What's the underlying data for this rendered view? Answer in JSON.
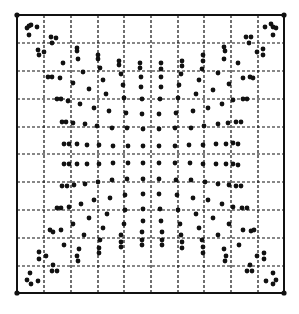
{
  "diagram": {
    "type": "dot-grid-distortion",
    "colors": {
      "background": "#ffffff",
      "ink": "#111111"
    },
    "frame": {
      "x0": 17,
      "y0": 15,
      "x1": 284,
      "y1": 293
    },
    "grid": {
      "columns": 10,
      "rows": 10,
      "vertical_lines": [
        44,
        71,
        98,
        124,
        151,
        178,
        204,
        231,
        258
      ],
      "horizontal_lines": [
        43,
        71,
        99,
        127,
        154,
        182,
        210,
        238,
        266
      ]
    },
    "corner_markers": [
      [
        17,
        15
      ],
      [
        284,
        15
      ],
      [
        17,
        293
      ],
      [
        284,
        293
      ]
    ],
    "dot_radius": 2.4,
    "dots": [
      [
        27,
        28
      ],
      [
        29,
        26
      ],
      [
        31,
        25
      ],
      [
        37,
        27
      ],
      [
        29,
        35
      ],
      [
        51,
        37
      ],
      [
        56,
        38
      ],
      [
        52,
        43
      ],
      [
        38,
        50
      ],
      [
        44,
        52
      ],
      [
        39,
        55
      ],
      [
        77,
        48
      ],
      [
        77,
        51
      ],
      [
        78,
        59
      ],
      [
        63,
        63
      ],
      [
        98,
        55
      ],
      [
        98,
        59
      ],
      [
        100,
        68
      ],
      [
        83,
        72
      ],
      [
        119,
        61
      ],
      [
        119,
        65
      ],
      [
        121,
        74
      ],
      [
        140,
        63
      ],
      [
        140,
        68
      ],
      [
        141,
        77
      ],
      [
        48,
        77
      ],
      [
        52,
        77
      ],
      [
        60,
        78
      ],
      [
        73,
        83
      ],
      [
        89,
        89
      ],
      [
        103,
        80
      ],
      [
        123,
        85
      ],
      [
        141,
        87
      ],
      [
        57,
        99
      ],
      [
        61,
        99
      ],
      [
        68,
        101
      ],
      [
        80,
        104
      ],
      [
        94,
        108
      ],
      [
        106,
        94
      ],
      [
        109,
        111
      ],
      [
        124,
        98
      ],
      [
        126,
        113
      ],
      [
        142,
        99
      ],
      [
        142,
        114
      ],
      [
        62,
        122
      ],
      [
        66,
        122
      ],
      [
        73,
        123
      ],
      [
        85,
        124
      ],
      [
        97,
        126
      ],
      [
        112,
        128
      ],
      [
        127,
        128
      ],
      [
        143,
        129
      ],
      [
        64,
        144
      ],
      [
        69,
        144
      ],
      [
        77,
        144
      ],
      [
        87,
        145
      ],
      [
        99,
        145
      ],
      [
        113,
        146
      ],
      [
        128,
        146
      ],
      [
        143,
        146
      ],
      [
        265,
        27
      ],
      [
        271,
        24
      ],
      [
        273,
        27
      ],
      [
        276,
        28
      ],
      [
        273,
        35
      ],
      [
        246,
        37
      ],
      [
        251,
        37
      ],
      [
        249,
        43
      ],
      [
        257,
        52
      ],
      [
        263,
        49
      ],
      [
        263,
        55
      ],
      [
        224,
        47
      ],
      [
        225,
        51
      ],
      [
        224,
        59
      ],
      [
        238,
        63
      ],
      [
        203,
        55
      ],
      [
        203,
        61
      ],
      [
        202,
        69
      ],
      [
        182,
        61
      ],
      [
        182,
        66
      ],
      [
        181,
        74
      ],
      [
        161,
        63
      ],
      [
        161,
        69
      ],
      [
        161,
        77
      ],
      [
        218,
        73
      ],
      [
        243,
        78
      ],
      [
        250,
        77
      ],
      [
        253,
        78
      ],
      [
        229,
        84
      ],
      [
        213,
        90
      ],
      [
        199,
        80
      ],
      [
        179,
        85
      ],
      [
        161,
        87
      ],
      [
        233,
        100
      ],
      [
        243,
        99
      ],
      [
        247,
        99
      ],
      [
        222,
        104
      ],
      [
        208,
        108
      ],
      [
        196,
        94
      ],
      [
        193,
        111
      ],
      [
        178,
        98
      ],
      [
        176,
        113
      ],
      [
        160,
        99
      ],
      [
        159,
        114
      ],
      [
        228,
        123
      ],
      [
        236,
        122
      ],
      [
        241,
        122
      ],
      [
        218,
        124
      ],
      [
        204,
        126
      ],
      [
        191,
        128
      ],
      [
        175,
        128
      ],
      [
        159,
        129
      ],
      [
        216,
        144
      ],
      [
        226,
        144
      ],
      [
        233,
        143
      ],
      [
        238,
        144
      ],
      [
        203,
        145
      ],
      [
        189,
        145
      ],
      [
        175,
        146
      ],
      [
        159,
        146
      ],
      [
        64,
        164
      ],
      [
        69,
        164
      ],
      [
        77,
        164
      ],
      [
        87,
        164
      ],
      [
        99,
        164
      ],
      [
        113,
        163
      ],
      [
        128,
        163
      ],
      [
        143,
        163
      ],
      [
        62,
        186
      ],
      [
        67,
        186
      ],
      [
        74,
        185
      ],
      [
        85,
        184
      ],
      [
        98,
        182
      ],
      [
        112,
        180
      ],
      [
        127,
        179
      ],
      [
        143,
        179
      ],
      [
        57,
        208
      ],
      [
        61,
        208
      ],
      [
        69,
        207
      ],
      [
        81,
        204
      ],
      [
        94,
        200
      ],
      [
        107,
        214
      ],
      [
        110,
        198
      ],
      [
        125,
        195
      ],
      [
        125,
        210
      ],
      [
        124,
        224
      ],
      [
        143,
        194
      ],
      [
        143,
        209
      ],
      [
        143,
        221
      ],
      [
        50,
        230
      ],
      [
        53,
        232
      ],
      [
        61,
        230
      ],
      [
        73,
        224
      ],
      [
        89,
        218
      ],
      [
        103,
        228
      ],
      [
        64,
        245
      ],
      [
        84,
        235
      ],
      [
        100,
        240
      ],
      [
        99,
        248
      ],
      [
        99,
        253
      ],
      [
        121,
        235
      ],
      [
        121,
        242
      ],
      [
        121,
        247
      ],
      [
        142,
        232
      ],
      [
        142,
        240
      ],
      [
        142,
        245
      ],
      [
        79,
        249
      ],
      [
        77,
        256
      ],
      [
        78,
        261
      ],
      [
        39,
        252
      ],
      [
        39,
        259
      ],
      [
        46,
        256
      ],
      [
        53,
        265
      ],
      [
        52,
        271
      ],
      [
        57,
        271
      ],
      [
        30,
        273
      ],
      [
        27,
        280
      ],
      [
        31,
        284
      ],
      [
        38,
        281
      ],
      [
        159,
        163
      ],
      [
        175,
        163
      ],
      [
        190,
        163
      ],
      [
        203,
        164
      ],
      [
        216,
        164
      ],
      [
        226,
        164
      ],
      [
        233,
        164
      ],
      [
        238,
        165
      ],
      [
        159,
        179
      ],
      [
        176,
        180
      ],
      [
        191,
        180
      ],
      [
        205,
        182
      ],
      [
        218,
        184
      ],
      [
        229,
        185
      ],
      [
        236,
        186
      ],
      [
        241,
        186
      ],
      [
        159,
        194
      ],
      [
        177,
        195
      ],
      [
        193,
        198
      ],
      [
        208,
        200
      ],
      [
        222,
        204
      ],
      [
        233,
        207
      ],
      [
        242,
        208
      ],
      [
        247,
        208
      ],
      [
        160,
        209
      ],
      [
        178,
        210
      ],
      [
        196,
        214
      ],
      [
        213,
        218
      ],
      [
        229,
        224
      ],
      [
        243,
        230
      ],
      [
        251,
        231
      ],
      [
        254,
        230
      ],
      [
        161,
        221
      ],
      [
        180,
        224
      ],
      [
        199,
        228
      ],
      [
        218,
        235
      ],
      [
        162,
        232
      ],
      [
        162,
        240
      ],
      [
        162,
        245
      ],
      [
        181,
        235
      ],
      [
        182,
        242
      ],
      [
        182,
        248
      ],
      [
        202,
        240
      ],
      [
        203,
        247
      ],
      [
        203,
        253
      ],
      [
        224,
        249
      ],
      [
        226,
        256
      ],
      [
        225,
        261
      ],
      [
        239,
        245
      ],
      [
        257,
        256
      ],
      [
        264,
        253
      ],
      [
        264,
        259
      ],
      [
        250,
        265
      ],
      [
        247,
        271
      ],
      [
        252,
        271
      ],
      [
        273,
        273
      ],
      [
        266,
        281
      ],
      [
        273,
        284
      ],
      [
        276,
        280
      ]
    ]
  }
}
